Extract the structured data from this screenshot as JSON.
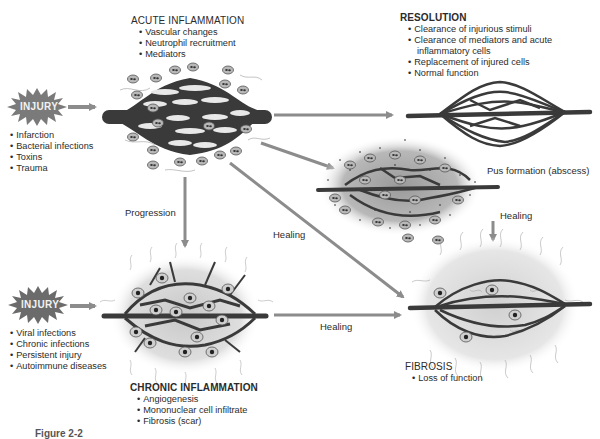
{
  "figure": {
    "caption_partial": "Figure 2-2"
  },
  "injury_acute": {
    "label": "INJURY",
    "causes": [
      "Infarction",
      "Bacterial infections",
      "Toxins",
      "Trauma"
    ]
  },
  "injury_chronic": {
    "label": "INJURY",
    "causes": [
      "Viral infections",
      "Chronic infections",
      "Persistent injury",
      "Autoimmune diseases"
    ]
  },
  "acute_inflammation": {
    "title": "ACUTE INFLAMMATION",
    "features": [
      "Vascular changes",
      "Neutrophil recruitment",
      "Mediators"
    ]
  },
  "resolution": {
    "title": "RESOLUTION",
    "features": [
      "Clearance of injurious stimuli",
      "Clearance of mediators and acute",
      "inflammatory cells",
      "Replacement of injured cells",
      "Normal function"
    ]
  },
  "abscess": {
    "label": "Pus formation (abscess)"
  },
  "chronic_inflammation": {
    "title": "CHRONIC INFLAMMATION",
    "features": [
      "Angiogenesis",
      "Mononuclear cell infiltrate",
      "Fibrosis (scar)"
    ]
  },
  "fibrosis": {
    "title": "FIBROSIS",
    "features": [
      "Loss of function"
    ]
  },
  "arrows": {
    "progression": "Progression",
    "healing_diagonal": "Healing",
    "healing_abscess": "Healing",
    "healing_chronic": "Healing"
  },
  "colors": {
    "vessel": "#3a3a3a",
    "arrow": "#8c8c8c",
    "injury_star": "#7a7a7a",
    "cell": "#b5b5b5",
    "background": "#ffffff"
  }
}
